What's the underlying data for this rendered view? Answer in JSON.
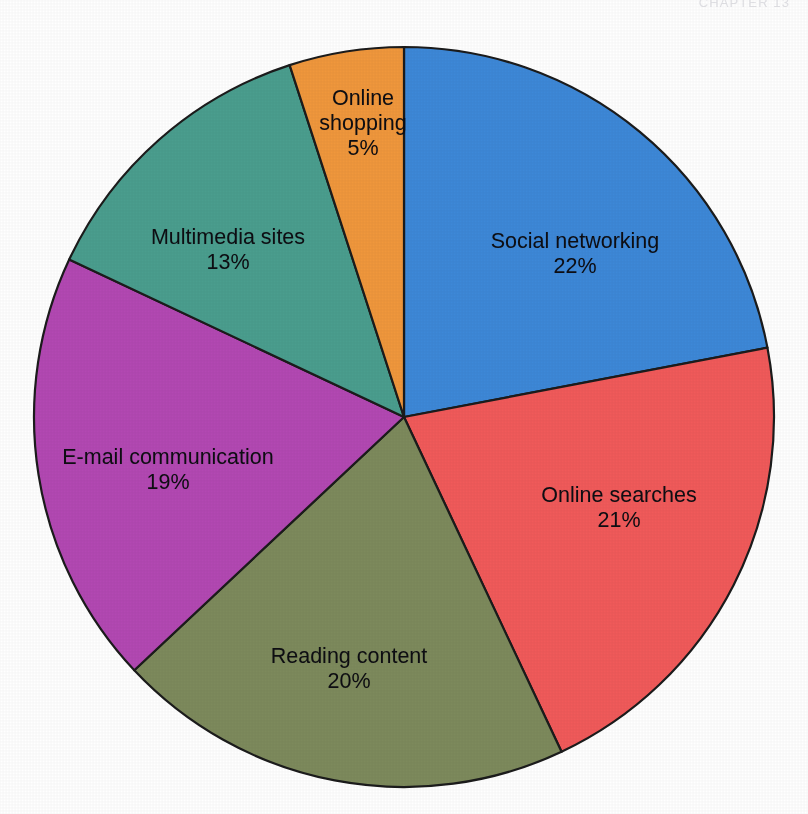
{
  "page": {
    "running_head": "CHAPTER 13"
  },
  "chart_data": {
    "type": "pie",
    "title": "",
    "xlabel": "",
    "ylabel": "",
    "legend_position": "none",
    "labels_inside_slices": true,
    "start_angle_deg": 0,
    "direction": "clockwise",
    "center": {
      "x": 404,
      "y": 417
    },
    "radius": 370,
    "total": 100,
    "unit": "%",
    "categories": [
      "Social networking",
      "Online searches",
      "Reading content",
      "E-mail communication",
      "Multimedia sites",
      "Online shopping"
    ],
    "values": [
      22,
      21,
      20,
      19,
      13,
      5
    ],
    "colors": [
      "#3d88d8",
      "#f15a5a",
      "#7d8a5c",
      "#b348b3",
      "#4a9e8e",
      "#f0973c"
    ],
    "slices": [
      {
        "name": "social-networking",
        "label": "Social networking",
        "value": 22,
        "value_text": "22%",
        "color": "#3d88d8",
        "label_lines": [
          "Social networking",
          "22%"
        ],
        "label_x": 575,
        "label_y": 254
      },
      {
        "name": "online-searches",
        "label": "Online searches",
        "value": 21,
        "value_text": "21%",
        "color": "#f15a5a",
        "label_lines": [
          "Online searches",
          "21%"
        ],
        "label_x": 619,
        "label_y": 508
      },
      {
        "name": "reading-content",
        "label": "Reading content",
        "value": 20,
        "value_text": "20%",
        "color": "#7d8a5c",
        "label_lines": [
          "Reading content",
          "20%"
        ],
        "label_x": 349,
        "label_y": 669
      },
      {
        "name": "email-communication",
        "label": "E-mail communication",
        "value": 19,
        "value_text": "19%",
        "color": "#b348b3",
        "label_lines": [
          "E-mail communication",
          "19%"
        ],
        "label_x": 168,
        "label_y": 470
      },
      {
        "name": "multimedia-sites",
        "label": "Multimedia sites",
        "value": 13,
        "value_text": "13%",
        "color": "#4a9e8e",
        "label_lines": [
          "Multimedia sites",
          "13%"
        ],
        "label_x": 228,
        "label_y": 250
      },
      {
        "name": "online-shopping",
        "label": "Online shopping",
        "value": 5,
        "value_text": "5%",
        "color": "#f0973c",
        "label_lines": [
          "Online",
          "shopping",
          "5%"
        ],
        "label_x": 363,
        "label_y": 123
      }
    ]
  },
  "style": {
    "outline_color": "#1b1b1b",
    "background": "#ffffff",
    "label_color": "#0d0d12"
  }
}
